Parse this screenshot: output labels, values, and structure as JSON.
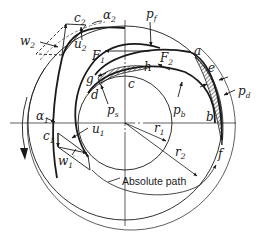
{
  "figure": {
    "colors": {
      "ink": "#1a1a1a",
      "background": "#ffffff"
    },
    "labels": {
      "c2": {
        "base": "c",
        "sub": "2"
      },
      "alpha2": {
        "base": "α",
        "sub": "2"
      },
      "w2": {
        "base": "w",
        "sub": "2"
      },
      "u2": {
        "base": "u",
        "sub": "2"
      },
      "pf": {
        "base": "p",
        "sub": "f"
      },
      "F1": {
        "base": "F",
        "sub": "1"
      },
      "F2": {
        "base": "F",
        "sub": "2"
      },
      "a": "a",
      "e": "e",
      "g": "g",
      "h": "h",
      "c": "c",
      "d": "d",
      "ps": {
        "base": "p",
        "sub": "s"
      },
      "pb": {
        "base": "p",
        "sub": "b"
      },
      "pd": {
        "base": "p",
        "sub": "d"
      },
      "b": "b",
      "f": "f",
      "alpha1": {
        "base": "α",
        "sub": "1"
      },
      "u1": {
        "base": "u",
        "sub": "1"
      },
      "c1": {
        "base": "c",
        "sub": "1"
      },
      "w1": {
        "base": "w",
        "sub": "1",
        "prime": "′"
      },
      "r1": {
        "base": "r",
        "sub": "1"
      },
      "r2": {
        "base": "r",
        "sub": "2"
      },
      "absolute_path": "Absolute path"
    }
  }
}
